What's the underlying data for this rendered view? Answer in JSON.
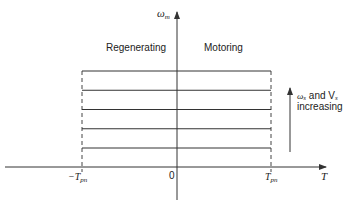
{
  "diagram": {
    "y_axis_label": "ω",
    "y_axis_sub": "m",
    "x_axis_label": "T",
    "origin_label": "0",
    "neg_limit_label": "−T",
    "neg_limit_sub": "pn",
    "pos_limit_label": "T",
    "pos_limit_sub": "pn",
    "region_left": "Regenerating",
    "region_right": "Motoring",
    "arrow_note_line1_prefix": "ω",
    "arrow_note_line1_sub": "s",
    "arrow_note_line1_mid": " and V",
    "arrow_note_line1_sub2": "s",
    "arrow_note_line2": "increasing",
    "speed_levels_count": 5,
    "line_color": "#333333"
  }
}
